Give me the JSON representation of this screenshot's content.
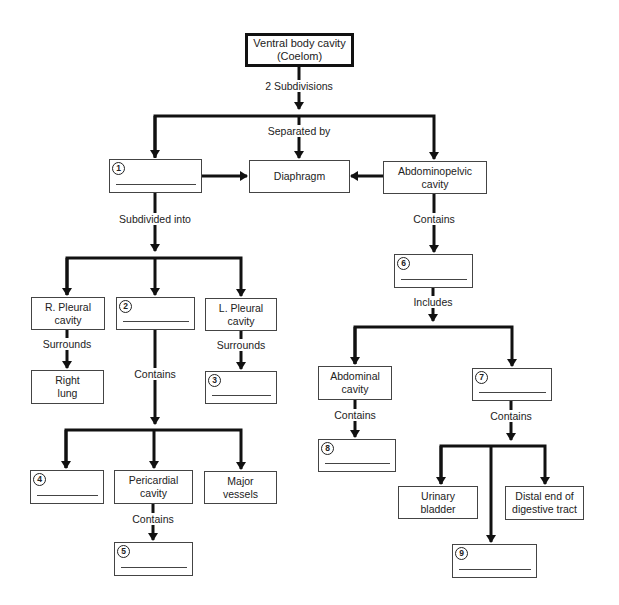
{
  "diagram": {
    "type": "flowchart",
    "nodes": {
      "root": {
        "label": "Ventral body cavity (Coelom)"
      },
      "blank1": {
        "number": "1",
        "label": ""
      },
      "diaphragm": {
        "label": "Diaphragm"
      },
      "abdominopelvic": {
        "label": "Abdominopelvic cavity"
      },
      "r_pleural": {
        "label": "R. Pleural cavity"
      },
      "blank2": {
        "number": "2",
        "label": ""
      },
      "l_pleural": {
        "label": "L. Pleural cavity"
      },
      "right_lung": {
        "label": "Right lung"
      },
      "blank3": {
        "number": "3",
        "label": ""
      },
      "blank4": {
        "number": "4",
        "label": ""
      },
      "pericardial": {
        "label": "Pericardial cavity"
      },
      "major_vessels": {
        "label": "Major vessels"
      },
      "blank5": {
        "number": "5",
        "label": ""
      },
      "blank6": {
        "number": "6",
        "label": ""
      },
      "abdominal": {
        "label": "Abdominal cavity"
      },
      "blank7": {
        "number": "7",
        "label": ""
      },
      "blank8": {
        "number": "8",
        "label": ""
      },
      "urinary": {
        "label": "Urinary bladder"
      },
      "distal": {
        "label": "Distal end of digestive tract"
      },
      "blank9": {
        "number": "9",
        "label": ""
      }
    },
    "edge_labels": {
      "two_subdivisions": "2 Subdivisions",
      "separated_by": "Separated by",
      "subdivided_into": "Subdivided into",
      "contains_abdominopelvic": "Contains",
      "surrounds_right": "Surrounds",
      "surrounds_left": "Surrounds",
      "contains_2": "Contains",
      "includes_6": "Includes",
      "contains_abdominal": "Contains",
      "contains_7": "Contains",
      "contains_pericardial": "Contains"
    },
    "root_line1": "Ventral body cavity",
    "root_line2": "(Coelom)",
    "abdominopelvic_line1": "Abdominopelvic",
    "abdominopelvic_line2": "cavity",
    "r_pleural_line1": "R. Pleural",
    "r_pleural_line2": "cavity",
    "l_pleural_line1": "L. Pleural",
    "l_pleural_line2": "cavity",
    "right_lung_line1": "Right",
    "right_lung_line2": "lung",
    "pericardial_line1": "Pericardial",
    "pericardial_line2": "cavity",
    "major_vessels_line1": "Major",
    "major_vessels_line2": "vessels",
    "abdominal_line1": "Abdominal",
    "abdominal_line2": "cavity",
    "urinary_line1": "Urinary",
    "urinary_line2": "bladder",
    "distal_line1": "Distal end of",
    "distal_line2": "digestive tract"
  }
}
